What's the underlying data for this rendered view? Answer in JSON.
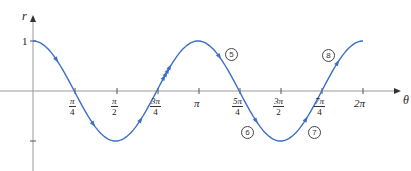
{
  "chart_data": {
    "type": "line",
    "title": "",
    "function": "r = cos(2θ)",
    "xlabel": "θ",
    "ylabel": "r",
    "x_ticks": [
      "π/4",
      "π/2",
      "3π/4",
      "π",
      "5π/4",
      "3π/2",
      "7π/4",
      "2π"
    ],
    "y_ticks": [
      "1",
      "-1"
    ],
    "xlim": [
      0,
      6.2832
    ],
    "ylim": [
      -1,
      1
    ],
    "grid": false,
    "series": [
      {
        "name": "r = cos 2θ",
        "color": "#3b6fc4",
        "x": [
          0,
          0.7854,
          1.5708,
          2.3562,
          3.1416,
          3.927,
          4.7124,
          5.4978,
          6.2832
        ],
        "values": [
          1,
          0,
          -1,
          0,
          1,
          0,
          -1,
          0,
          1
        ]
      }
    ],
    "annotations": [
      {
        "label": "⑤",
        "near": "between π and 5π/4, above axis"
      },
      {
        "label": "⑥",
        "near": "between 5π/4 and 3π/2, below axis"
      },
      {
        "label": "⑦",
        "near": "between 3π/2 and 7π/4, below axis"
      },
      {
        "label": "⑧",
        "near": "between 7π/4 and 2π, above axis"
      }
    ],
    "direction_arrows": "single arrows along each loop segment, quadruple arrow near 3π/4 rising"
  },
  "labels": {
    "y_axis": "r",
    "x_axis": "θ",
    "y_one": "1",
    "ticks": {
      "pi4": {
        "num": "π",
        "den": "4"
      },
      "pi2": {
        "num": "π",
        "den": "2"
      },
      "3pi4": {
        "num": "3π",
        "den": "4"
      },
      "pi": "π",
      "5pi4": {
        "num": "5π",
        "den": "4"
      },
      "3pi2": {
        "num": "3π",
        "den": "2"
      },
      "7pi4": {
        "num": "7π",
        "den": "4"
      },
      "2pi": "2π"
    },
    "markers": {
      "m5": "5",
      "m6": "6",
      "m7": "7",
      "m8": "8"
    }
  }
}
